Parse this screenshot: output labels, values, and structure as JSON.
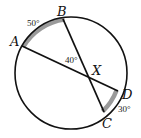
{
  "diagram": {
    "type": "circle-intersecting-chords",
    "points": {
      "A": {
        "label": "A"
      },
      "B": {
        "label": "B"
      },
      "C": {
        "label": "C"
      },
      "D": {
        "label": "D"
      },
      "X": {
        "label": "X"
      }
    },
    "chords": [
      {
        "from": "A",
        "to": "D",
        "through": "X"
      },
      {
        "from": "B",
        "to": "C",
        "through": "X"
      }
    ],
    "arcs": [
      {
        "from": "A",
        "to": "B",
        "measure": "50°",
        "shaded": true
      },
      {
        "from": "C",
        "to": "D",
        "measure": "30°",
        "shaded": true
      }
    ],
    "angles": [
      {
        "vertex": "X",
        "between": [
          "A",
          "B"
        ],
        "measure": "40°"
      }
    ],
    "colors": {
      "stroke": "#111111",
      "shade": "#9a9a9a"
    }
  }
}
